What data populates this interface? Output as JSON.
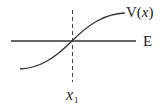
{
  "diagram": {
    "title": "",
    "labels": {
      "potential": {
        "prefix": "V(",
        "variable": "x",
        "suffix": ")"
      },
      "energy": "E",
      "turning_point": {
        "variable": "x",
        "subscript": "1"
      }
    },
    "elements": {
      "energy_line": {
        "x1": 11,
        "y1": 41,
        "x2": 136,
        "y2": 41
      },
      "dashed_line": {
        "x": 72.5,
        "y1": 10,
        "y2": 82
      },
      "potential_curve": {
        "start": [
          20,
          69
        ],
        "crossing": [
          72,
          41
        ],
        "end": [
          125,
          13
        ]
      }
    },
    "colors": {
      "stroke": "#333333",
      "text": "#222222",
      "background": "#ffffff"
    }
  }
}
